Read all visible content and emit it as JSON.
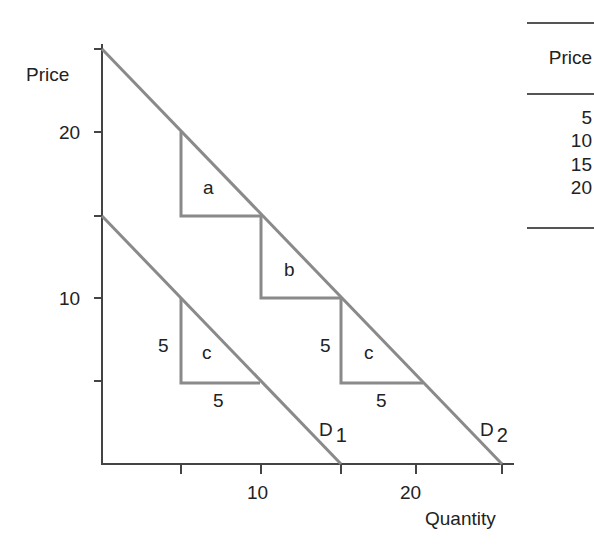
{
  "axes": {
    "y_label": "Price",
    "x_label": "Quantity",
    "y_ticks": [
      {
        "value": 25,
        "label": ""
      },
      {
        "value": 20,
        "label": "20"
      },
      {
        "value": 15,
        "label": ""
      },
      {
        "value": 10,
        "label": "10"
      },
      {
        "value": 5,
        "label": ""
      }
    ],
    "x_ticks": [
      {
        "value": 5,
        "label": ""
      },
      {
        "value": 10,
        "label": "10"
      },
      {
        "value": 15,
        "label": ""
      },
      {
        "value": 20,
        "label": "20"
      },
      {
        "value": 25,
        "label": ""
      }
    ]
  },
  "curves": {
    "d1": {
      "name": "D",
      "subscript": "1",
      "from": [
        0,
        15
      ],
      "to": [
        15,
        0
      ]
    },
    "d2": {
      "name": "D",
      "subscript": "2",
      "from": [
        0,
        25
      ],
      "to": [
        25,
        0
      ]
    }
  },
  "triangles": {
    "a": {
      "label": "a",
      "apex": [
        5,
        20
      ],
      "corner": [
        5,
        15
      ],
      "base_end": [
        10,
        15
      ]
    },
    "b": {
      "label": "b",
      "apex": [
        10,
        15
      ],
      "corner": [
        10,
        10
      ],
      "base_end": [
        15,
        10
      ]
    },
    "c_d2": {
      "label": "c",
      "apex": [
        15,
        10
      ],
      "corner": [
        15,
        5
      ],
      "base_end": [
        20,
        5
      ],
      "side_label": "5",
      "base_label": "5"
    },
    "c_d1": {
      "label": "c",
      "apex": [
        5,
        10
      ],
      "corner": [
        5,
        5
      ],
      "base_end": [
        10,
        5
      ],
      "side_label": "5",
      "base_label": "5"
    }
  },
  "table": {
    "header": "Price",
    "rows": [
      "5",
      "10",
      "15",
      "20"
    ]
  },
  "colors": {
    "curve": "#8a8a8a",
    "axis": "#444444",
    "text": "#222222"
  }
}
